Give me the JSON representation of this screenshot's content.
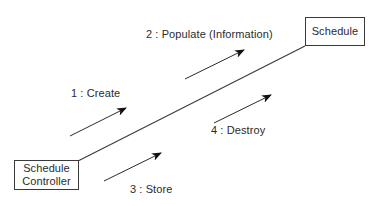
{
  "diagram": {
    "type": "uml-collaboration-diagram",
    "background_color": "#ffffff",
    "line_color": "#3a3a3a",
    "text_color": "#2b2b2b",
    "objects": [
      {
        "id": "schedule-controller",
        "name_line_1": "Schedule",
        "name_line_2": "Controller",
        "x": 14,
        "y": 160,
        "width": 65,
        "height": 30
      },
      {
        "id": "schedule",
        "name_line_1": "Schedule",
        "name_line_2": "",
        "x": 305,
        "y": 17,
        "width": 60,
        "height": 29
      }
    ],
    "association_link": {
      "from": "schedule-controller",
      "to": "schedule",
      "x1": 78,
      "y1": 161,
      "x2": 305,
      "y2": 46
    },
    "messages": [
      {
        "sequence": "1",
        "label": "1 : Create",
        "name": "Create",
        "direction": "to-schedule",
        "x1": 70,
        "y1": 136,
        "x2": 126,
        "y2": 108
      },
      {
        "sequence": "2",
        "label": "2 : Populate (Information)",
        "name": "Populate (Information)",
        "direction": "to-schedule",
        "x1": 185,
        "y1": 79,
        "x2": 244,
        "y2": 50
      },
      {
        "sequence": "3",
        "label": "3 : Store",
        "name": "Store",
        "direction": "to-schedule",
        "x1": 104,
        "y1": 181,
        "x2": 161,
        "y2": 153
      },
      {
        "sequence": "4",
        "label": "4 : Destroy",
        "name": "Destroy",
        "direction": "to-schedule",
        "x1": 214,
        "y1": 123,
        "x2": 271,
        "y2": 95
      }
    ]
  }
}
